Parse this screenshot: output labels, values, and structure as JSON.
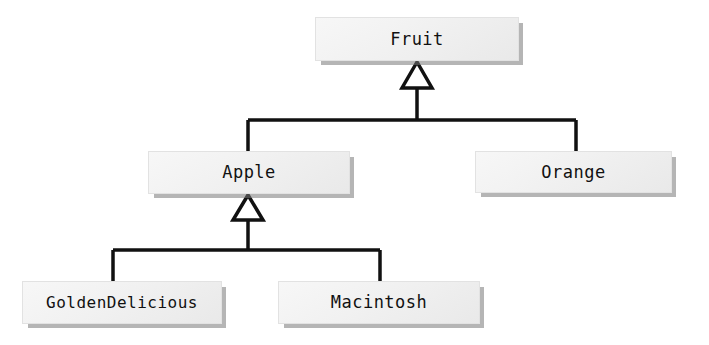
{
  "diagram": {
    "type": "uml-class-inheritance",
    "background_color": "#ffffff",
    "line_color": "#111111",
    "box_fill_color": "#f1f1f1",
    "box_shadow_color": "#787878",
    "nodes": {
      "fruit": {
        "label": "Fruit"
      },
      "apple": {
        "label": "Apple"
      },
      "orange": {
        "label": "Orange"
      },
      "golden_delicious": {
        "label": "GoldenDelicious"
      },
      "macintosh": {
        "label": "Macintosh"
      }
    },
    "generalizations": [
      {
        "child": "Apple",
        "parent": "Fruit"
      },
      {
        "child": "Orange",
        "parent": "Fruit"
      },
      {
        "child": "GoldenDelicious",
        "parent": "Apple"
      },
      {
        "child": "Macintosh",
        "parent": "Apple"
      }
    ]
  }
}
